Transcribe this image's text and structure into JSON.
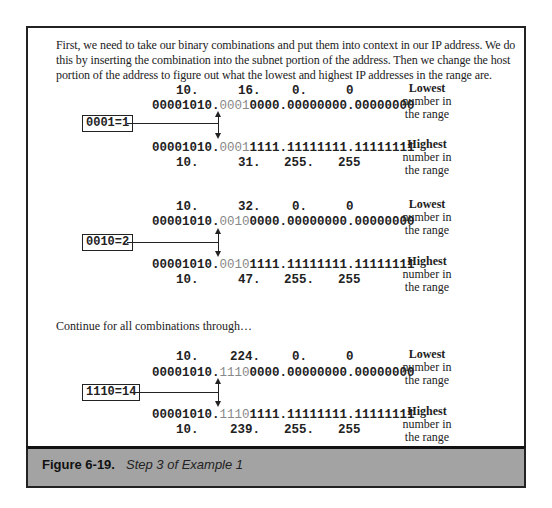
{
  "intro_text": "First, we need to take our binary combinations and put them into context in our IP address. We do this by inserting the combination into the subnet portion of the address. Then we change the host portion of the address to figure out what the lowest and highest IP addresses in the range are.",
  "continue_text": "Continue for all combinations through…",
  "labels": {
    "lowest_bold": "Lowest",
    "lowest_rest": "number in the range",
    "highest_bold": "Highest",
    "highest_rest": "number in the range"
  },
  "examples": [
    {
      "tag": "0001=1",
      "low_decimal": [
        "10.",
        "16.",
        "0.",
        "0"
      ],
      "low_binary": {
        "prefix": "00001010.",
        "subnet": "0001",
        "rest": "0000.00000000.00000000"
      },
      "high_binary": {
        "prefix": "00001010.",
        "subnet": "0001",
        "rest": "1111.11111111.11111111"
      },
      "high_decimal": [
        "10.",
        "31.",
        "255.",
        "255"
      ]
    },
    {
      "tag": "0010=2",
      "low_decimal": [
        "10.",
        "32.",
        "0.",
        "0"
      ],
      "low_binary": {
        "prefix": "00001010.",
        "subnet": "0010",
        "rest": "0000.00000000.00000000"
      },
      "high_binary": {
        "prefix": "00001010.",
        "subnet": "0010",
        "rest": "1111.11111111.11111111"
      },
      "high_decimal": [
        "10.",
        "47.",
        "255.",
        "255"
      ]
    },
    {
      "tag": "1110=14",
      "low_decimal": [
        "10.",
        "224.",
        "0.",
        "0"
      ],
      "low_binary": {
        "prefix": "00001010.",
        "subnet": "1110",
        "rest": "0000.00000000.00000000"
      },
      "high_binary": {
        "prefix": "00001010.",
        "subnet": "1110",
        "rest": "1111.11111111.11111111"
      },
      "high_decimal": [
        "10.",
        "239.",
        "255.",
        "255"
      ]
    }
  ],
  "caption": {
    "label": "Figure 6-19.",
    "text": "Step 3 of Example 1"
  }
}
